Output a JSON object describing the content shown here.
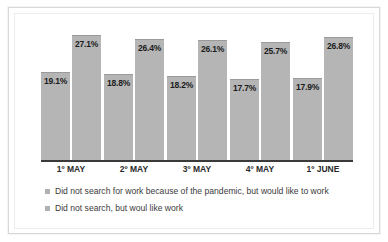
{
  "chart_data": {
    "type": "bar",
    "title": "",
    "subtitle": "",
    "xlabel": "",
    "ylabel": "",
    "grid": false,
    "legend_position": "bottom",
    "ylim": [
      0,
      30
    ],
    "value_suffix": "%",
    "categories": [
      "1º MAY",
      "2º MAY",
      "3º MAY",
      "4º MAY",
      "1º JUNE"
    ],
    "series": [
      {
        "name": "Did not search for work because of the pandemic, but would like to work",
        "color": "#b5b5b5",
        "values": [
          19.1,
          18.8,
          18.2,
          17.7,
          17.9
        ],
        "labels": [
          "19.1%",
          "18.8%",
          "18.2%",
          "17.7%",
          "17.9%"
        ]
      },
      {
        "name": "Did not search, but woul like work",
        "color": "#b5b5b5",
        "values": [
          27.1,
          26.4,
          26.1,
          25.7,
          26.8
        ],
        "labels": [
          "27.1%",
          "26.4%",
          "26.1%",
          "25.7%",
          "26.8%"
        ]
      }
    ]
  },
  "legend": {
    "items": [
      {
        "label": "Did not search for work because of the pandemic, but would like to work"
      },
      {
        "label": "Did not search, but woul like work"
      }
    ]
  },
  "style": {
    "bar_color": "#b5b5b5",
    "axis_color": "#3a3a3a",
    "label_color": "#1c1c1c",
    "frame_color": "#d8d8d8"
  }
}
